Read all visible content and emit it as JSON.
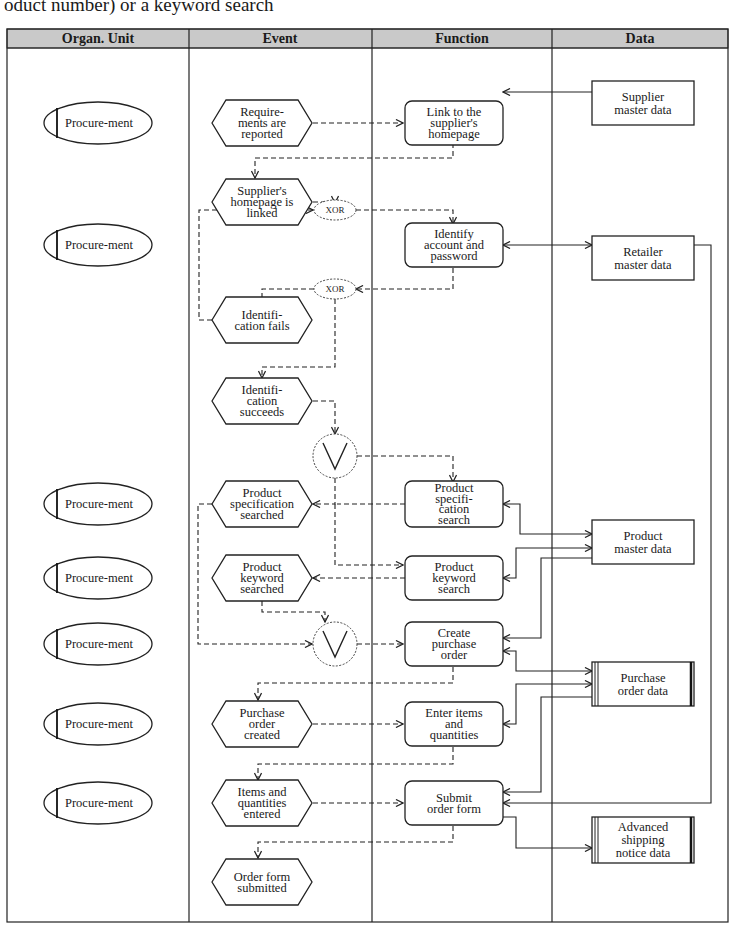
{
  "caption": "oduct number) or a keyword search",
  "lanes": {
    "headers": [
      "Organ. Unit",
      "Event",
      "Function",
      "Data"
    ],
    "header_bg": "#c9c9c9"
  },
  "org_units": [
    {
      "label": "Procure-ment",
      "y": 123
    },
    {
      "label": "Procure-ment",
      "y": 245
    },
    {
      "label": "Procure-ment",
      "y": 504
    },
    {
      "label": "Procure-ment",
      "y": 578
    },
    {
      "label": "Procure-ment",
      "y": 644
    },
    {
      "label": "Procure-ment",
      "y": 724
    },
    {
      "label": "Procure-ment",
      "y": 803
    }
  ],
  "events": [
    {
      "id": "e1",
      "lines": [
        "Requir­-",
        "ments are",
        "reported"
      ],
      "text": [
        "Require-",
        "ments are",
        "reported"
      ],
      "y": 123
    },
    {
      "id": "e2",
      "text": [
        "Supplier's",
        "homepage is",
        "linked"
      ],
      "y": 202
    },
    {
      "id": "e3",
      "text": [
        "Identifi-",
        "cation fails"
      ],
      "y": 320
    },
    {
      "id": "e4",
      "text": [
        "Identifi-",
        "cation",
        "succeeds"
      ],
      "y": 401
    },
    {
      "id": "e5",
      "text": [
        "Product",
        "specification",
        "searched"
      ],
      "y": 504
    },
    {
      "id": "e6",
      "text": [
        "Product",
        "keyword",
        "searched"
      ],
      "y": 578
    },
    {
      "id": "e7",
      "text": [
        "Purchase",
        "order",
        "created"
      ],
      "y": 724
    },
    {
      "id": "e8",
      "text": [
        "Items and",
        "quantities",
        "entered"
      ],
      "y": 803
    },
    {
      "id": "e9",
      "text": [
        "Order form",
        "submitted"
      ],
      "y": 882
    }
  ],
  "functions": [
    {
      "id": "f1",
      "text": [
        "Link to the",
        "supplier's",
        "homepage"
      ],
      "y": 123
    },
    {
      "id": "f2",
      "text": [
        "Identify",
        "account and",
        "password"
      ],
      "y": 245
    },
    {
      "id": "f3",
      "text": [
        "Product",
        "specifi-",
        "cation",
        "search"
      ],
      "y": 504
    },
    {
      "id": "f4",
      "text": [
        "Product",
        "keyword",
        "search"
      ],
      "y": 578
    },
    {
      "id": "f5",
      "text": [
        "Create",
        "purchase",
        "order"
      ],
      "y": 644
    },
    {
      "id": "f6",
      "text": [
        "Enter items",
        "and",
        "quantities"
      ],
      "y": 724
    },
    {
      "id": "f7",
      "text": [
        "Submit",
        "order form"
      ],
      "y": 803
    }
  ],
  "data_objects": [
    {
      "id": "d1",
      "text": [
        "Supplier",
        "master data"
      ],
      "y": 103,
      "type": "entity"
    },
    {
      "id": "d2",
      "text": [
        "Retailer",
        "master data"
      ],
      "y": 258,
      "type": "entity"
    },
    {
      "id": "d3",
      "text": [
        "Product",
        "master data"
      ],
      "y": 542,
      "type": "entity"
    },
    {
      "id": "d4",
      "text": [
        "Purchase",
        "order data"
      ],
      "y": 684,
      "type": "document"
    },
    {
      "id": "d5",
      "text": [
        "Advanced",
        "shipping",
        "notice data"
      ],
      "y": 840,
      "type": "document"
    }
  ],
  "connectors": [
    {
      "id": "xor1",
      "label": "XOR",
      "y": 210
    },
    {
      "id": "xor2",
      "label": "XOR",
      "y": 289
    },
    {
      "id": "or1",
      "label": "OR",
      "y": 456
    },
    {
      "id": "or2",
      "label": "OR",
      "y": 644
    }
  ]
}
